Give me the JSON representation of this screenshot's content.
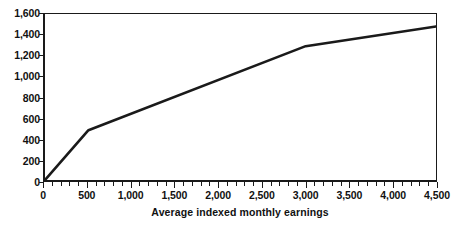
{
  "chart_data": {
    "type": "line",
    "title": "",
    "xlabel": "Average indexed monthly earnings",
    "ylabel": "",
    "xlim": [
      0,
      4500
    ],
    "ylim": [
      0,
      1600
    ],
    "grid": false,
    "legend": null,
    "x_ticks": [
      0,
      500,
      1000,
      1500,
      2000,
      2500,
      3000,
      3500,
      4000,
      4500
    ],
    "x_tick_labels": [
      "0",
      "500",
      "1,000",
      "1,500",
      "2,000",
      "2,500",
      "3,000",
      "3,500",
      "4,000",
      "4,500"
    ],
    "x_minor_tick_step": 100,
    "y_ticks": [
      0,
      200,
      400,
      600,
      800,
      1000,
      1200,
      1400,
      1600
    ],
    "y_tick_labels": [
      "0",
      "200",
      "400",
      "600",
      "800",
      "1,000",
      "1,200",
      "1,400",
      "1,600"
    ],
    "series": [
      {
        "name": "Monthly benefit",
        "color": "#1a1a1a",
        "line_width": 2.6,
        "x": [
          0,
          500,
          3000,
          4500
        ],
        "values": [
          0,
          480,
          1290,
          1480
        ]
      }
    ],
    "bend_points": [
      {
        "x": 500,
        "y": 480
      },
      {
        "x": 3000,
        "y": 1290
      }
    ]
  }
}
